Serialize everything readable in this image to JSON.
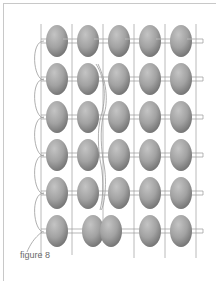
{
  "figure": {
    "caption": "figure 8",
    "grid": {
      "columns": 5,
      "rows": 6
    },
    "colors": {
      "bead_light": "#b8b8b8",
      "bead_dark": "#7a7a7a",
      "thread": "#9a9a9a",
      "frame": "#c8c8c8",
      "caption": "#6a6a6a"
    }
  }
}
